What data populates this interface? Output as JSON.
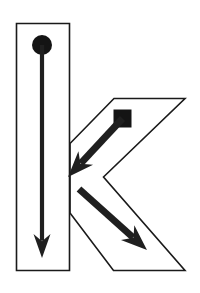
{
  "diagram": {
    "letter": "k",
    "letter_case": "lowercase",
    "canvas": {
      "width": 200,
      "height": 293
    },
    "colors": {
      "background": "#ffffff",
      "outline": "#1a1a1a",
      "stroke_arrow": "#1f1f1f",
      "start_marker": "#141414"
    },
    "outline": {
      "name": "letter-k-outline",
      "stroke_width": 1.6,
      "fill": "none",
      "stem_path": "M16.5,23.5 L69.5,23.5 L69.5,270.5 L16.5,270.5 Z",
      "arm_leg_path": "M185,98.5 L114,98.5 L70,143.5 L70,213 L113.5,270.5 L185,270.5 L103.5,177 Z"
    },
    "strokes": [
      {
        "order": 1,
        "name": "stroke-1-vertical-stem",
        "description": "Vertical downward stroke forming the stem",
        "start_marker": "circle",
        "start_point": {
          "x": 42,
          "y": 45
        },
        "end_point": {
          "x": 42,
          "y": 258
        },
        "direction": "down",
        "marker_radius": 10,
        "shaft_width": 4.2,
        "arrowhead_length": 24,
        "arrowhead_width": 17
      },
      {
        "order": 2,
        "name": "stroke-2-upper-diagonal",
        "description": "Diagonal stroke from upper right down to the stem junction",
        "start_marker": "square",
        "start_point": {
          "x": 122.5,
          "y": 118.5
        },
        "end_point": {
          "x": 68,
          "y": 177
        },
        "direction": "down-left",
        "marker_size": 18,
        "shaft_width": 7,
        "arrowhead_length": 26,
        "arrowhead_width": 20
      },
      {
        "order": 3,
        "name": "stroke-3-lower-diagonal",
        "description": "Diagonal leg stroke from the junction down to the lower right",
        "start_marker": "none",
        "start_point": {
          "x": 79,
          "y": 189
        },
        "end_point": {
          "x": 147,
          "y": 250
        },
        "direction": "down-right",
        "shaft_width": 7,
        "arrowhead_length": 26,
        "arrowhead_width": 20
      }
    ]
  }
}
